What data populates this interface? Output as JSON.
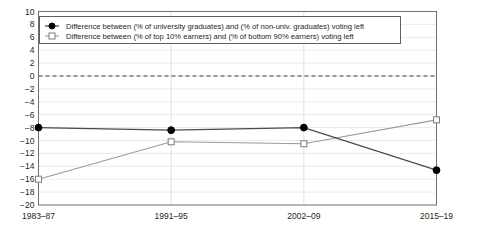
{
  "chart_data": {
    "type": "line",
    "title": "",
    "xlabel": "",
    "ylabel": "",
    "categories": [
      "1983–87",
      "1991–95",
      "2002–09",
      "2015–19"
    ],
    "series": [
      {
        "name": "Difference between (% of university graduates) and (% of non-univ. graduates) voting left",
        "values": [
          -8.0,
          -8.4,
          -8.0,
          -14.6
        ],
        "marker": "filled-circle",
        "color": "#4a4a4a"
      },
      {
        "name": "Difference between (% of top 10% earners) and (% of bottom 90% earners) voting left",
        "values": [
          -16.0,
          -10.2,
          -10.5,
          -6.8
        ],
        "marker": "open-square",
        "color": "#9a9a9a"
      }
    ],
    "ylim": [
      -20,
      10
    ],
    "ytick_step": 2,
    "yticks": [
      10,
      8,
      6,
      4,
      2,
      0,
      -2,
      -4,
      -6,
      -8,
      -10,
      -12,
      -14,
      -16,
      -18,
      -20
    ],
    "ytick_labels": [
      "10",
      "8",
      "6",
      "4",
      "2",
      "0",
      "−2",
      "−4",
      "−6",
      "−8",
      "−10",
      "−12",
      "−14",
      "−16",
      "−18",
      "−20"
    ],
    "grid": true,
    "zero_reference_line": 0,
    "legend_position": "top-left-inside"
  },
  "legend": {
    "entries": [
      {
        "label": "Difference between (% of university graduates) and (% of non-univ. graduates) voting left"
      },
      {
        "label": "Difference between (% of top 10% earners) and (% of bottom 90% earners) voting left"
      }
    ]
  }
}
